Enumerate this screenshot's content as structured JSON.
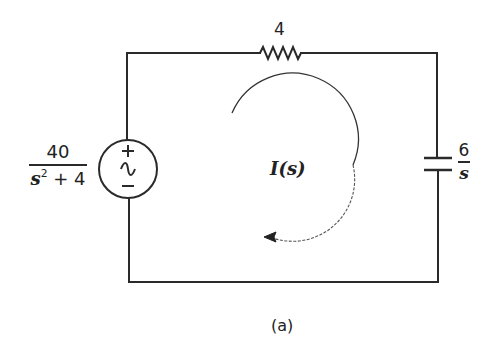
{
  "diagram": {
    "type": "circuit",
    "caption": "(a)",
    "colors": {
      "line": "#2a2a2a",
      "text": "#222222",
      "background": "#ffffff"
    },
    "source": {
      "kind": "ac-voltage-source",
      "plus_symbol": "+",
      "minus_symbol": "−",
      "wave_symbol": "~",
      "value": {
        "numerator": "40",
        "denominator_base": "s",
        "denominator_exp": "2",
        "denominator_rest": " + 4"
      }
    },
    "resistor": {
      "kind": "resistor",
      "value": "4"
    },
    "capacitor": {
      "kind": "capacitor",
      "value": {
        "numerator": "6",
        "denominator": "s"
      }
    },
    "current": {
      "label": "I(s)",
      "direction": "clockwise"
    }
  }
}
